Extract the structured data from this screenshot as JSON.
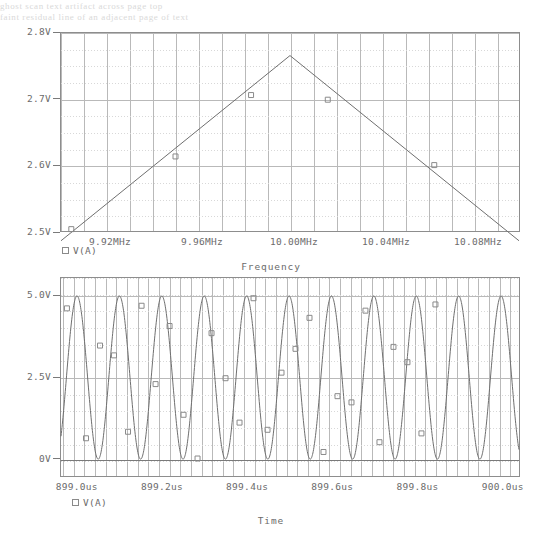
{
  "page": {
    "background": "#ffffff",
    "ink": "#5a5a5a",
    "grid_major": "#b9b9b9",
    "grid_minor": "#d8d8d8",
    "trace_color": "#6f6f6f",
    "marker_color": "#8a8a8a",
    "ghost_top_line1": "ghost scan text artifact across page top",
    "ghost_top_line2": "faint residual line of an adjacent page of text"
  },
  "charts": [
    {
      "id": "frequency-response",
      "type": "line",
      "title": "",
      "xlabel": "Frequency",
      "ylabel": "",
      "legend": {
        "marker": "open-square",
        "label": "V(A)",
        "position": "below-axis-left"
      },
      "grid": true,
      "xlim": [
        9.9,
        10.1
      ],
      "ylim": [
        2.5,
        2.8
      ],
      "xunit": "MHz",
      "yunit": "V",
      "xticks": [
        {
          "value": 9.92,
          "label": "9.92MHz"
        },
        {
          "value": 9.96,
          "label": "9.96MHz"
        },
        {
          "value": 10.0,
          "label": "10.00MHz"
        },
        {
          "value": 10.04,
          "label": "10.04MHz"
        },
        {
          "value": 10.08,
          "label": "10.08MHz"
        }
      ],
      "yticks": [
        {
          "value": 2.5,
          "label": "2.5V"
        },
        {
          "value": 2.6,
          "label": "2.6V"
        },
        {
          "value": 2.7,
          "label": "2.7V"
        },
        {
          "value": 2.8,
          "label": "2.8V"
        }
      ],
      "series": [
        {
          "name": "V(A)",
          "x": [
            9.9,
            10.0,
            10.1
          ],
          "y": [
            2.487,
            2.766,
            2.487
          ]
        }
      ],
      "markers": [
        {
          "x": 9.9045,
          "y": 2.5045
        },
        {
          "x": 9.95,
          "y": 2.614
        },
        {
          "x": 9.983,
          "y": 2.7065
        },
        {
          "x": 10.0165,
          "y": 2.6995
        },
        {
          "x": 10.063,
          "y": 2.601
        }
      ]
    },
    {
      "id": "time-domain",
      "type": "line",
      "title": "",
      "xlabel": "Time",
      "ylabel": "",
      "legend": {
        "marker": "open-square",
        "label": "V(A)",
        "position": "below-axis-left"
      },
      "grid": true,
      "xlim": [
        898.97,
        900.05
      ],
      "ylim": [
        -0.55,
        5.55
      ],
      "xunit": "us",
      "yunit": "V",
      "xticks": [
        {
          "value": 899.0,
          "label": "899.0us"
        },
        {
          "value": 899.2,
          "label": "899.2us"
        },
        {
          "value": 899.4,
          "label": "899.4us"
        },
        {
          "value": 899.6,
          "label": "899.6us"
        },
        {
          "value": 899.8,
          "label": "899.8us"
        },
        {
          "value": 900.0,
          "label": "900.0us"
        }
      ],
      "yticks": [
        {
          "value": 0.0,
          "label": "0V"
        },
        {
          "value": 2.5,
          "label": "2.5V"
        },
        {
          "value": 5.0,
          "label": "5.0V"
        }
      ],
      "waveform": {
        "name": "V(A)",
        "shape": "sine",
        "amplitude": 2.5,
        "offset": 2.5,
        "period_us": 0.1,
        "cycles": 10.8,
        "phase_deg": 62
      },
      "markers": [
        {
          "x": 898.984,
          "y": 4.62
        },
        {
          "x": 899.029,
          "y": 0.64
        },
        {
          "x": 899.062,
          "y": 3.48
        },
        {
          "x": 899.095,
          "y": 3.18
        },
        {
          "x": 899.128,
          "y": 0.84
        },
        {
          "x": 899.16,
          "y": 4.7
        },
        {
          "x": 899.193,
          "y": 2.3
        },
        {
          "x": 899.226,
          "y": 4.08
        },
        {
          "x": 899.259,
          "y": 1.36
        },
        {
          "x": 899.292,
          "y": 0.02
        },
        {
          "x": 899.325,
          "y": 3.86
        },
        {
          "x": 899.358,
          "y": 2.48
        },
        {
          "x": 899.391,
          "y": 1.12
        },
        {
          "x": 899.424,
          "y": 4.93
        },
        {
          "x": 899.457,
          "y": 0.9
        },
        {
          "x": 899.49,
          "y": 2.65
        },
        {
          "x": 899.523,
          "y": 3.38
        },
        {
          "x": 899.556,
          "y": 4.33
        },
        {
          "x": 899.589,
          "y": 0.22
        },
        {
          "x": 899.622,
          "y": 1.93
        },
        {
          "x": 899.655,
          "y": 1.74
        },
        {
          "x": 899.688,
          "y": 4.55
        },
        {
          "x": 899.721,
          "y": 0.52
        },
        {
          "x": 899.754,
          "y": 3.44
        },
        {
          "x": 899.787,
          "y": 2.97
        },
        {
          "x": 899.82,
          "y": 0.79
        },
        {
          "x": 899.853,
          "y": 4.74
        }
      ]
    }
  ]
}
